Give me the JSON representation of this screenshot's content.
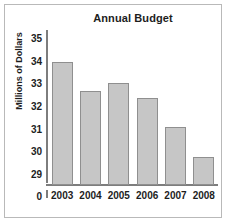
{
  "chart_data": {
    "type": "bar",
    "title": "Annual Budget",
    "xlabel": "",
    "ylabel": "Millions of Dollars",
    "categories": [
      "2003",
      "2004",
      "2005",
      "2006",
      "2007",
      "2008"
    ],
    "values": [
      34.05,
      32.75,
      33.1,
      32.45,
      31.15,
      29.85
    ],
    "ylim": [
      28.6,
      35.4
    ],
    "yticks": [
      35,
      34,
      33,
      32,
      31,
      30,
      29
    ],
    "ytick_labels": [
      "35",
      "34",
      "33",
      "32",
      "31",
      "30",
      "29"
    ],
    "origin_label": "0",
    "axis_break": true,
    "grid": false,
    "legend": false,
    "bar_color": "#c6c6c6",
    "bar_border_color": "#8f8f8f",
    "axis_color": "#7d7d7d",
    "text_color": "#1d1d1d",
    "frame_color": "#b9b9b9",
    "background": "#ffffff"
  }
}
